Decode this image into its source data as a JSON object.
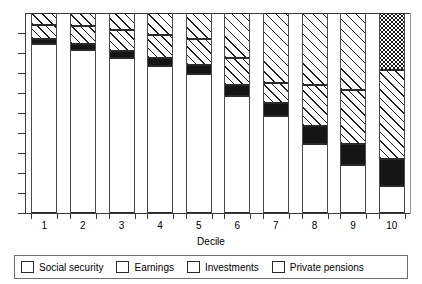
{
  "chart_data": {
    "type": "bar",
    "subtype": "stacked-bar-100-percent",
    "title": "",
    "xlabel": "Decile",
    "ylabel": "",
    "categories": [
      "1",
      "2",
      "3",
      "4",
      "5",
      "6",
      "7",
      "8",
      "9",
      "10"
    ],
    "ylim": [
      0,
      100
    ],
    "grid": false,
    "y_tick_count": 10,
    "legend_position": "bottom",
    "series": [
      {
        "name": "Social security",
        "pattern": "blank",
        "values": [
          84.5,
          81.5,
          77.5,
          73.5,
          69.5,
          58.5,
          48.5,
          34.5,
          24.0,
          13.5
        ]
      },
      {
        "name": "Earnings",
        "pattern": "solid-black",
        "values": [
          2.5,
          3.0,
          3.5,
          4.0,
          4.5,
          5.5,
          6.5,
          9.0,
          10.5,
          13.5
        ]
      },
      {
        "name": "Investments",
        "pattern": "diagonal-hatch",
        "values": [
          7.0,
          9.0,
          10.5,
          11.5,
          13.0,
          13.5,
          10.0,
          20.5,
          27.0,
          44.5
        ]
      },
      {
        "name": "Private pensions",
        "pattern": "cross-hatch",
        "values": [
          6.0,
          6.5,
          8.5,
          11.0,
          13.0,
          22.5,
          35.0,
          36.0,
          38.5,
          28.5
        ]
      }
    ]
  },
  "axis": {
    "x_title": "Decile",
    "x_tick_labels": [
      "1",
      "2",
      "3",
      "4",
      "5",
      "6",
      "7",
      "8",
      "9",
      "10"
    ]
  },
  "legend": {
    "items": [
      {
        "label": "Social security",
        "pattern": "blank"
      },
      {
        "label": "Earnings",
        "pattern": "solid-black"
      },
      {
        "label": "Investments",
        "pattern": "diagonal-hatch"
      },
      {
        "label": "Private pensions",
        "pattern": "cross-hatch"
      }
    ]
  },
  "colors": {
    "ink": "#1f1f1f",
    "axis": "#3a3a3a",
    "background": "#ffffff"
  }
}
